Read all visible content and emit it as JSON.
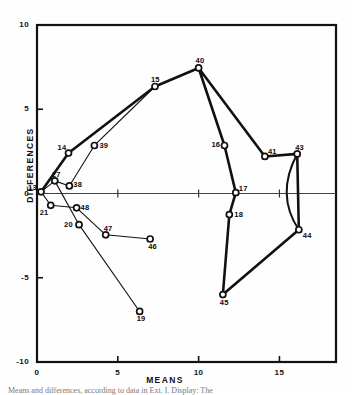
{
  "figure": {
    "caption": "Means and differences, according to data in Ext. I. Display: The"
  },
  "chart_data": {
    "type": "scatter",
    "title": "",
    "xlabel": "MEANS",
    "ylabel": "DIFFERENCES",
    "xlim": [
      0,
      18.5
    ],
    "ylim": [
      -10,
      10
    ],
    "xticks": [
      0,
      5,
      10,
      15
    ],
    "xtick_labels": [
      "0",
      "5",
      "10",
      "15"
    ],
    "yticks": [
      10,
      5,
      0,
      -5,
      -10
    ],
    "ytick_labels": [
      "10",
      "5",
      "0",
      "-5",
      "-10"
    ],
    "grid": false,
    "legend": "none",
    "marker": "open-square-circle",
    "points": [
      {
        "id": "13",
        "x": 0.25,
        "y": 0.1,
        "label_dx": -13,
        "label_dy": -9
      },
      {
        "id": "27",
        "x": 1.1,
        "y": 0.75,
        "label_dx": -3,
        "label_dy": -11
      },
      {
        "id": "21",
        "x": 0.85,
        "y": -0.7,
        "label_dx": -11,
        "label_dy": 3
      },
      {
        "id": "38",
        "x": 2.0,
        "y": 0.45,
        "label_dx": 4,
        "label_dy": -6
      },
      {
        "id": "48",
        "x": 2.45,
        "y": -0.85,
        "label_dx": 4,
        "label_dy": -5
      },
      {
        "id": "14",
        "x": 1.95,
        "y": 2.4,
        "label_dx": -11,
        "label_dy": -10
      },
      {
        "id": "39",
        "x": 3.55,
        "y": 2.85,
        "label_dx": 5,
        "label_dy": -4
      },
      {
        "id": "15",
        "x": 7.3,
        "y": 6.35,
        "label_dx": -4,
        "label_dy": -12
      },
      {
        "id": "40",
        "x": 10.0,
        "y": 7.45,
        "label_dx": -3,
        "label_dy": -12
      },
      {
        "id": "16",
        "x": 11.6,
        "y": 2.85,
        "label_dx": -13,
        "label_dy": -5
      },
      {
        "id": "41",
        "x": 14.1,
        "y": 2.2,
        "label_dx": 3,
        "label_dy": -9
      },
      {
        "id": "43",
        "x": 16.1,
        "y": 2.35,
        "label_dx": -2,
        "label_dy": -11
      },
      {
        "id": "17",
        "x": 12.3,
        "y": 0.05,
        "label_dx": 3,
        "label_dy": -9
      },
      {
        "id": "18",
        "x": 11.9,
        "y": -1.25,
        "label_dx": 5,
        "label_dy": -5
      },
      {
        "id": "44",
        "x": 16.2,
        "y": -2.15,
        "label_dx": 4,
        "label_dy": 1
      },
      {
        "id": "20",
        "x": 2.6,
        "y": -1.85,
        "label_dx": -15,
        "label_dy": -5
      },
      {
        "id": "47",
        "x": 4.25,
        "y": -2.45,
        "label_dx": -2,
        "label_dy": -11
      },
      {
        "id": "46",
        "x": 7.0,
        "y": -2.7,
        "label_dx": -2,
        "label_dy": 3
      },
      {
        "id": "19",
        "x": 6.35,
        "y": -7.0,
        "label_dx": -3,
        "label_dy": 3
      },
      {
        "id": "45",
        "x": 11.5,
        "y": -6.0,
        "label_dx": -3,
        "label_dy": 3
      }
    ],
    "series": [
      {
        "name": "thick-path",
        "stroke": "#111111",
        "width": 2.6,
        "ids": [
          "13",
          "14",
          "15",
          "40",
          "16",
          "17",
          "18",
          "45",
          "44",
          "43",
          "41",
          "40"
        ]
      },
      {
        "name": "thin-path",
        "stroke": "#111111",
        "width": 1.1,
        "ids": [
          "13",
          "27",
          "38",
          "39",
          "15"
        ]
      },
      {
        "name": "thin-lower-path",
        "stroke": "#111111",
        "width": 1.1,
        "ids": [
          "13",
          "21",
          "48",
          "47",
          "46"
        ]
      },
      {
        "name": "thin-descend-path",
        "stroke": "#111111",
        "width": 1.1,
        "ids": [
          "27",
          "20",
          "19"
        ]
      },
      {
        "name": "curve-43-44",
        "stroke": "#111111",
        "width": 2.0,
        "ids": [
          "43",
          "44"
        ]
      }
    ]
  },
  "colors": {
    "ink": "#111111",
    "paper": "#fefefe"
  }
}
